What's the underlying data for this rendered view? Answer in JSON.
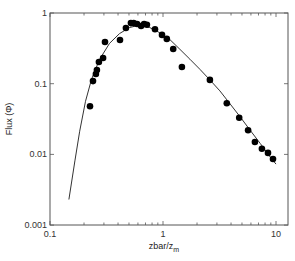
{
  "chart_data": {
    "type": "scatter",
    "title": "",
    "xlabel": "zbar/z",
    "xlabel_subscript": "m",
    "ylabel": "Flux (Φ)",
    "xscale": "log",
    "yscale": "log",
    "xlim": [
      0.1,
      12
    ],
    "ylim": [
      0.001,
      1
    ],
    "x_ticks": [
      0.1,
      1,
      10
    ],
    "x_tick_labels": [
      "0.1",
      "1",
      "10"
    ],
    "y_ticks": [
      0.001,
      0.01,
      0.1,
      1
    ],
    "y_tick_labels": [
      "0.001",
      "0.01",
      "0.1",
      "1"
    ],
    "grid": false,
    "legend": null,
    "series": [
      {
        "name": "measured",
        "kind": "scatter",
        "marker": "filled-circle",
        "color": "#000000",
        "x": [
          0.226,
          0.24,
          0.255,
          0.26,
          0.271,
          0.295,
          0.307,
          0.416,
          0.47,
          0.52,
          0.55,
          0.59,
          0.64,
          0.68,
          0.72,
          0.85,
          0.98,
          1.08,
          1.23,
          1.47,
          2.6,
          3.67,
          4.72,
          5.66,
          6.5,
          7.5,
          8.5,
          9.4
        ],
        "y": [
          0.048,
          0.109,
          0.137,
          0.156,
          0.203,
          0.231,
          0.389,
          0.415,
          0.614,
          0.72,
          0.72,
          0.7,
          0.655,
          0.7,
          0.68,
          0.59,
          0.49,
          0.43,
          0.31,
          0.172,
          0.113,
          0.053,
          0.033,
          0.022,
          0.015,
          0.012,
          0.0105,
          0.0086
        ]
      },
      {
        "name": "fit",
        "kind": "line",
        "color": "#333333",
        "x": [
          0.147,
          0.166,
          0.183,
          0.206,
          0.233,
          0.274,
          0.336,
          0.412,
          0.506,
          0.621,
          0.762,
          0.935,
          1.15,
          1.41,
          1.73,
          2.12,
          2.6,
          3.19,
          3.92,
          4.81,
          5.9,
          7.24,
          8.89,
          10.0
        ],
        "y": [
          0.0023,
          0.0081,
          0.0213,
          0.0564,
          0.115,
          0.22,
          0.371,
          0.512,
          0.623,
          0.675,
          0.623,
          0.527,
          0.42,
          0.307,
          0.222,
          0.16,
          0.113,
          0.079,
          0.052,
          0.034,
          0.022,
          0.0143,
          0.0092,
          0.0073
        ]
      }
    ]
  },
  "plot_frame": {
    "left": 50,
    "top": 13,
    "right": 288,
    "bottom": 225,
    "x_px_per_decade": 113,
    "y_px_per_decade": 70.7
  }
}
